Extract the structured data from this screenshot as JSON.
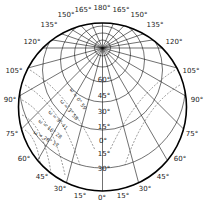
{
  "diagram": {
    "type": "polar-stereographic-grid",
    "colors": {
      "line": "#111111",
      "dashed": "#333333",
      "background": "#ffffff"
    },
    "outer_labels": [
      {
        "text": "180°",
        "x": 102,
        "y": 8
      },
      {
        "text": "165°",
        "x": 83,
        "y": 10
      },
      {
        "text": "165°",
        "x": 121,
        "y": 10
      },
      {
        "text": "150°",
        "x": 66,
        "y": 15
      },
      {
        "text": "150°",
        "x": 139,
        "y": 15
      },
      {
        "text": "135°",
        "x": 49,
        "y": 25
      },
      {
        "text": "135°",
        "x": 155,
        "y": 25
      },
      {
        "text": "120°",
        "x": 32,
        "y": 42
      },
      {
        "text": "120°",
        "x": 174,
        "y": 42
      },
      {
        "text": "105°",
        "x": 14,
        "y": 71
      },
      {
        "text": "105°",
        "x": 191,
        "y": 71
      },
      {
        "text": "90°",
        "x": 10,
        "y": 100
      },
      {
        "text": "90°",
        "x": 197,
        "y": 100
      },
      {
        "text": "75°",
        "x": 12,
        "y": 134
      },
      {
        "text": "75°",
        "x": 192,
        "y": 134
      },
      {
        "text": "60°",
        "x": 24,
        "y": 159
      },
      {
        "text": "60°",
        "x": 180,
        "y": 159
      },
      {
        "text": "45°",
        "x": 42,
        "y": 177
      },
      {
        "text": "45°",
        "x": 163,
        "y": 177
      },
      {
        "text": "30°",
        "x": 60,
        "y": 189
      },
      {
        "text": "30°",
        "x": 145,
        "y": 189
      },
      {
        "text": "15°",
        "x": 80,
        "y": 196
      },
      {
        "text": "15°",
        "x": 123,
        "y": 196
      },
      {
        "text": "0°",
        "x": 102,
        "y": 198
      }
    ],
    "center_scale_labels": [
      {
        "text": "60°",
        "x": 104,
        "y": 80
      },
      {
        "text": "45°",
        "x": 104,
        "y": 96
      },
      {
        "text": "30°",
        "x": 104,
        "y": 112
      },
      {
        "text": "15°",
        "x": 104,
        "y": 127
      },
      {
        "text": "0°",
        "x": 103,
        "y": 141
      },
      {
        "text": "15°",
        "x": 104,
        "y": 154
      },
      {
        "text": "30°",
        "x": 104,
        "y": 169
      }
    ],
    "omega_labels": [
      {
        "text": "ω = 0° 59",
        "x": 78,
        "y": 99,
        "rot": 55
      },
      {
        "text": "ω = 3° 58",
        "x": 69,
        "y": 110,
        "rot": 50
      },
      {
        "text": "ω = 9° 41",
        "x": 58,
        "y": 120,
        "rot": 45
      },
      {
        "text": "ω = 16° 28",
        "x": 50,
        "y": 129,
        "rot": 38
      },
      {
        "text": "ω = 26° 17",
        "x": 46,
        "y": 139,
        "rot": 30
      }
    ]
  }
}
